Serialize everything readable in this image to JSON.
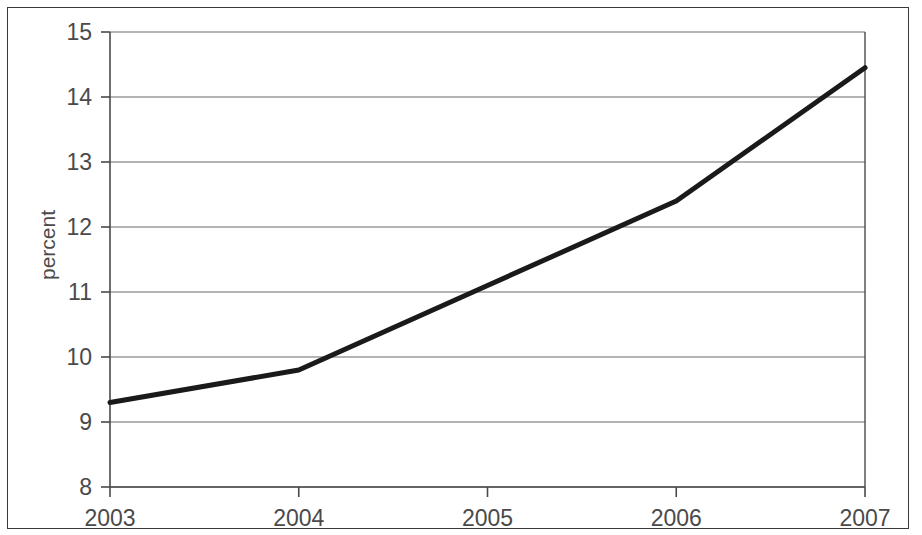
{
  "chart_data": {
    "type": "line",
    "title": "",
    "subtitle": "",
    "xlabel": "",
    "ylabel": "percent",
    "x": [
      2003,
      2004,
      2005,
      2006,
      2007
    ],
    "categories": [
      "2003",
      "2004",
      "2005",
      "2006",
      "2007"
    ],
    "values": [
      9.3,
      9.8,
      11.1,
      12.4,
      14.45
    ],
    "series": [
      {
        "name": "percent",
        "values": [
          9.3,
          9.8,
          11.1,
          12.4,
          14.45
        ],
        "color": "#1a1a1a",
        "line_width": 5
      }
    ],
    "xlim": [
      2003,
      2007
    ],
    "ylim": [
      8,
      15
    ],
    "x_ticks": [
      "2003",
      "2004",
      "2005",
      "2006",
      "2007"
    ],
    "y_ticks": [
      "8",
      "9",
      "10",
      "11",
      "12",
      "13",
      "14",
      "15"
    ],
    "grid": "horizontal",
    "grid_color": "#6b6b6b",
    "legend": "none",
    "axis_color": "#4a4a4a",
    "background": "#ffffff",
    "frame_color": "#3a3a3a"
  },
  "axes": {
    "y_title": "percent",
    "y_ticks": [
      {
        "label": "15",
        "value": 15
      },
      {
        "label": "14",
        "value": 14
      },
      {
        "label": "13",
        "value": 13
      },
      {
        "label": "12",
        "value": 12
      },
      {
        "label": "11",
        "value": 11
      },
      {
        "label": "10",
        "value": 10
      },
      {
        "label": "9",
        "value": 9
      },
      {
        "label": "8",
        "value": 8
      }
    ],
    "x_ticks": [
      {
        "label": "2003",
        "value": 2003
      },
      {
        "label": "2004",
        "value": 2004
      },
      {
        "label": "2005",
        "value": 2005
      },
      {
        "label": "2006",
        "value": 2006
      },
      {
        "label": "2007",
        "value": 2007
      }
    ]
  }
}
